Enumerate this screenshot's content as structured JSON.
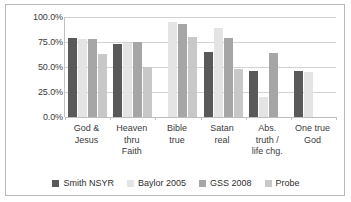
{
  "chart_data": {
    "type": "bar",
    "title": "",
    "subtitle": "",
    "xlabel": "",
    "ylabel": "",
    "ylim": [
      0,
      100
    ],
    "yticks": [
      0,
      25,
      50,
      75,
      100
    ],
    "ytick_labels": [
      "0.0%",
      "25.0%",
      "50.0%",
      "75.0%",
      "100.0%"
    ],
    "grid": true,
    "legend_position": "bottom",
    "categories": [
      "God &\nJesus",
      "Heaven\nthru\nFaith",
      "Bible\ntrue",
      "Satan\nreal",
      "Abs.\ntruth /\nlife chg.",
      "One true\nGod"
    ],
    "category_lines": [
      [
        "God &",
        "Jesus"
      ],
      [
        "Heaven",
        "thru",
        "Faith"
      ],
      [
        "Bible",
        "true"
      ],
      [
        "Satan",
        "real"
      ],
      [
        "Abs.",
        "truth /",
        "life chg."
      ],
      [
        "One true",
        "God"
      ]
    ],
    "series": [
      {
        "name": "Smith NSYR",
        "color": "#595959",
        "values": [
          79,
          73,
          null,
          65,
          46,
          46
        ]
      },
      {
        "name": "Baylor 2005",
        "color": "#e4e4e4",
        "values": [
          78,
          74,
          95,
          89,
          20,
          45
        ]
      },
      {
        "name": "GSS 2008",
        "color": "#a6a6a6",
        "values": [
          78,
          75,
          93,
          79,
          64,
          null
        ]
      },
      {
        "name": "Probe",
        "color": "#c8c8c8",
        "values": [
          63,
          50,
          80,
          48,
          null,
          null
        ]
      }
    ]
  },
  "legend": {
    "items": [
      {
        "label": "Smith NSYR",
        "color": "#595959"
      },
      {
        "label": "Baylor 2005",
        "color": "#e4e4e4"
      },
      {
        "label": "GSS 2008",
        "color": "#a6a6a6"
      },
      {
        "label": "Probe",
        "color": "#c8c8c8"
      }
    ]
  },
  "frame": {
    "border_color": "#b9b9b9",
    "background": "#ffffff",
    "gridline_color": "#d2d2d2"
  }
}
